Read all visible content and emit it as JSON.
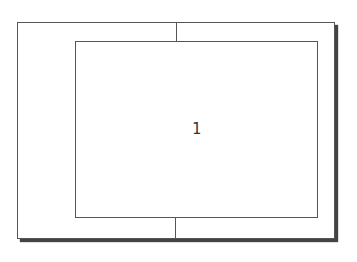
{
  "diagram": {
    "type": "nested-frame",
    "outer_frame": {
      "shadow": true,
      "stroke": "#555555",
      "shadow_color": "#444444"
    },
    "inner_frame": {
      "label": "1",
      "stroke": "#555555"
    },
    "connectors": [
      {
        "position": "top",
        "from": "outer-frame-top",
        "to": "inner-frame-top"
      },
      {
        "position": "bottom",
        "from": "inner-frame-bottom",
        "to": "outer-frame-bottom"
      }
    ]
  }
}
